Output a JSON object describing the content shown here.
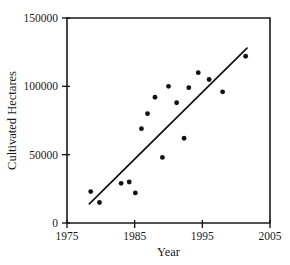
{
  "chart_data": {
    "type": "scatter",
    "title": "",
    "xlabel": "Year",
    "ylabel": "Cultivated Hectares",
    "xlim": [
      1975,
      2005
    ],
    "ylim": [
      0,
      150000
    ],
    "grid": false,
    "legend": "none",
    "x_ticks": [
      1975,
      1985,
      1995,
      2005
    ],
    "x_tick_labels": [
      "1975",
      "1985",
      "1995",
      "2005"
    ],
    "y_ticks": [
      0,
      50000,
      100000,
      150000
    ],
    "y_tick_labels": [
      "0",
      "50000",
      "100000",
      "150000"
    ],
    "points": [
      {
        "x": 1978.5,
        "y": 23000
      },
      {
        "x": 1979.8,
        "y": 15000
      },
      {
        "x": 1983.0,
        "y": 29000
      },
      {
        "x": 1984.2,
        "y": 30000
      },
      {
        "x": 1985.1,
        "y": 22000
      },
      {
        "x": 1986.0,
        "y": 69000
      },
      {
        "x": 1986.9,
        "y": 80000
      },
      {
        "x": 1988.0,
        "y": 92000
      },
      {
        "x": 1989.1,
        "y": 48000
      },
      {
        "x": 1990.0,
        "y": 100000
      },
      {
        "x": 1991.2,
        "y": 88000
      },
      {
        "x": 1992.3,
        "y": 62000
      },
      {
        "x": 1993.0,
        "y": 99000
      },
      {
        "x": 1994.4,
        "y": 110000
      },
      {
        "x": 1996.0,
        "y": 105000
      },
      {
        "x": 1998.0,
        "y": 96000
      },
      {
        "x": 2001.4,
        "y": 122000
      }
    ],
    "trend_line": {
      "label": "linear fit",
      "x_start": 1978.3,
      "y_start": 14000,
      "x_end": 2001.6,
      "y_end": 128000
    }
  },
  "geometry": {
    "plot_left": 67,
    "plot_right": 270,
    "plot_top": 18,
    "plot_bottom": 223
  }
}
